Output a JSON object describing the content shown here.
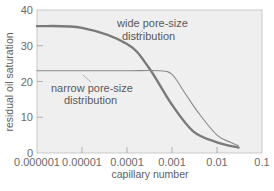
{
  "chart_data": {
    "type": "line",
    "title": "",
    "xlabel": "capillary number",
    "ylabel": "residual oil saturation",
    "xscale": "log",
    "xlim": [
      1e-06,
      0.1
    ],
    "ylim": [
      0,
      40
    ],
    "x_ticks": [
      "0.000001",
      "0.00001",
      "0.0001",
      "0.001",
      "0.01",
      "0.1"
    ],
    "y_ticks": [
      "0",
      "10",
      "20",
      "30",
      "40"
    ],
    "grid": false,
    "legend": "none (curves labeled by in-plot annotations)",
    "series": [
      {
        "name": "wide pore-size distribution",
        "style": "thick",
        "color": "#7a7a7a",
        "x": [
          1e-06,
          1e-05,
          0.0001,
          0.0003,
          0.001,
          0.003,
          0.01,
          0.03
        ],
        "y": [
          35.5,
          35,
          30.5,
          24,
          13.5,
          6,
          3,
          1.5
        ]
      },
      {
        "name": "narrow pore-size distribution",
        "style": "thin",
        "color": "#8a8a8a",
        "x": [
          1e-06,
          1e-05,
          0.0001,
          0.0005,
          0.001,
          0.002,
          0.004,
          0.01,
          0.02,
          0.03
        ],
        "y": [
          23,
          23,
          23,
          23,
          22,
          16.5,
          11,
          5,
          3,
          2
        ]
      }
    ],
    "annotations": [
      {
        "text": [
          "wide pore-size",
          "distribution"
        ],
        "points_to": "wide pore-size distribution"
      },
      {
        "text": [
          "narrow pore-size",
          "distribution"
        ],
        "points_to": "narrow pore-size distribution"
      }
    ]
  },
  "labels": {
    "ylabel": "residual oil saturation",
    "xlabel": "capillary number",
    "wide_line1": "wide pore-size",
    "wide_line2": "distribution",
    "narrow_line1": "narrow pore-size",
    "narrow_line2": "distribution"
  },
  "colors": {
    "plot_background": "#efefef",
    "frame": "#b8b8b8",
    "wide_curve": "#7a7a7a",
    "narrow_curve": "#8a8a8a",
    "text": "#5e5e5e"
  }
}
